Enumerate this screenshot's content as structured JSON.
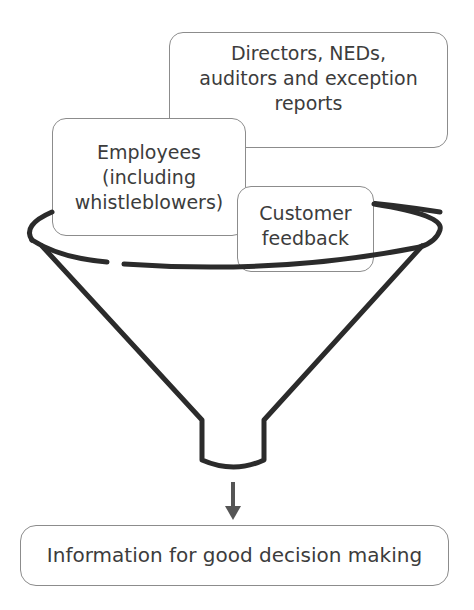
{
  "diagram": {
    "type": "funnel",
    "inputs": [
      {
        "id": "directors",
        "lines": [
          "Directors, NEDs,",
          "auditors and exception",
          "reports"
        ]
      },
      {
        "id": "employees",
        "lines": [
          "Employees",
          "(including",
          "whistleblowers)"
        ]
      },
      {
        "id": "customers",
        "lines": [
          "Customer",
          "feedback"
        ]
      }
    ],
    "output": {
      "label": "Information for good decision making"
    },
    "colors": {
      "stroke": "#2b2b2b",
      "box_border": "#8c8c8c",
      "text": "#3c3c3c",
      "arrow": "#555555"
    }
  }
}
